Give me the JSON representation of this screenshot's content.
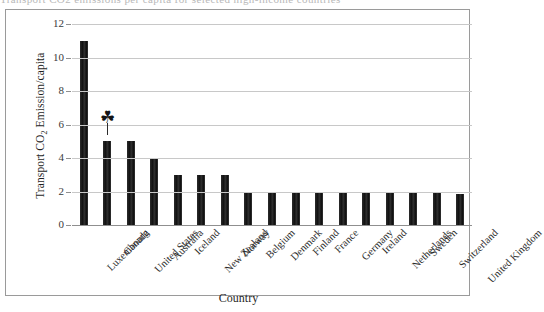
{
  "caption_remnant": "Transport CO2 emissions per capita for selected high-income countries",
  "chart_data": {
    "type": "bar",
    "title": "",
    "xlabel": "Country",
    "ylabel": "Transport CO2 Emission/capita",
    "ylabel_main": "Transport CO",
    "ylabel_sub": "2",
    "ylabel_tail": " Emission/capita",
    "ylim": [
      0,
      12
    ],
    "ytick_labels": [
      "12",
      "10",
      "8",
      "6",
      "4",
      "2",
      "0"
    ],
    "ytick_values": [
      12,
      10,
      8,
      6,
      4,
      2,
      0
    ],
    "grid": true,
    "legend": "none",
    "categories": [
      "Luxembourg",
      "Canada",
      "United States",
      "Australia",
      "Iceland",
      "New Zealand",
      "Norway",
      "Belgium",
      "Denmark",
      "Finland",
      "France",
      "Germany",
      "Ireland",
      "Netherlands",
      "Sweden",
      "Switzerland",
      "United Kingdom"
    ],
    "values": [
      11,
      5,
      5,
      4,
      3,
      3,
      3,
      1.9,
      1.9,
      1.9,
      1.9,
      1.9,
      1.9,
      1.9,
      1.9,
      1.9,
      1.85
    ],
    "bar_color": "#1c1c1c",
    "grid_color": "#c8c8c8",
    "axis_color": "#8f8f8f",
    "annotation": {
      "name": "canada-maple-leaf-marker",
      "category": "Canada",
      "glyph": "☘",
      "value": 6.1,
      "stem_bottom": 5.4
    }
  }
}
